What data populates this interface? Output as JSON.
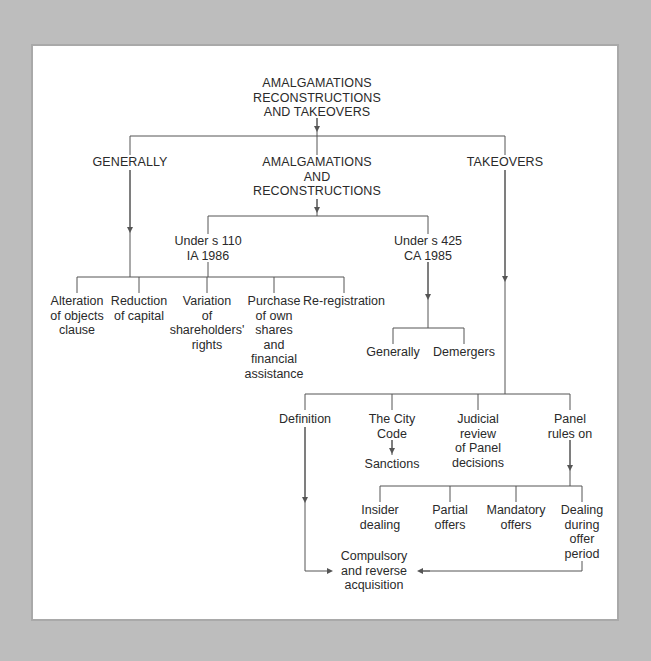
{
  "diagram": {
    "colors": {
      "background": "#bdbdbd",
      "panel": "#ffffff",
      "line": "#555555",
      "text": "#2a2a2a"
    },
    "root": {
      "lines": [
        "AMALGAMATIONS",
        "RECONSTRUCTIONS",
        "AND TAKEOVERS"
      ]
    },
    "level1": {
      "generally": {
        "lines": [
          "GENERALLY"
        ]
      },
      "amalgamations": {
        "lines": [
          "AMALGAMATIONS",
          "AND",
          "RECONSTRUCTIONS"
        ]
      },
      "takeovers": {
        "lines": [
          "TAKEOVERS"
        ]
      }
    },
    "amalgamations_children": {
      "s110": {
        "lines": [
          "Under s 110",
          "IA 1986"
        ]
      },
      "s425": {
        "lines": [
          "Under s 425",
          "CA 1985"
        ]
      }
    },
    "generally_children": [
      {
        "lines": [
          "Alteration",
          "of objects",
          "clause"
        ]
      },
      {
        "lines": [
          "Reduction",
          "of capital"
        ]
      },
      {
        "lines": [
          "Variation",
          "of",
          "shareholders'",
          "rights"
        ]
      },
      {
        "lines": [
          "Purchase",
          "of own",
          "shares",
          "and",
          "financial",
          "assistance"
        ]
      },
      {
        "lines": [
          "Re-registration"
        ]
      }
    ],
    "s425_children": [
      {
        "lines": [
          "Generally"
        ]
      },
      {
        "lines": [
          "Demergers"
        ]
      }
    ],
    "takeovers_children": [
      {
        "lines": [
          "Definition"
        ]
      },
      {
        "lines": [
          "The City",
          "Code"
        ]
      },
      {
        "lines": [
          "Judicial",
          "review",
          "of Panel",
          "decisions"
        ]
      },
      {
        "lines": [
          "Panel",
          "rules on"
        ]
      }
    ],
    "city_code_child": {
      "lines": [
        "Sanctions"
      ]
    },
    "panel_rules_children": [
      {
        "lines": [
          "Insider",
          "dealing"
        ]
      },
      {
        "lines": [
          "Partial",
          "offers"
        ]
      },
      {
        "lines": [
          "Mandatory",
          "offers"
        ]
      },
      {
        "lines": [
          "Dealing",
          "during",
          "offer",
          "period"
        ]
      }
    ],
    "final_node": {
      "lines": [
        "Compulsory",
        "and reverse",
        "acquisition"
      ]
    }
  }
}
